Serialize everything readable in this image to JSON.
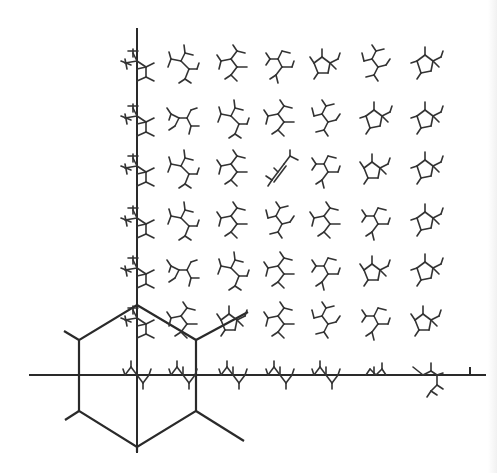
{
  "figure": {
    "type": "molecular-conformation-map",
    "ink_color": "#2a2a2a",
    "background": "#ffffff"
  },
  "axes": {
    "vertical": {
      "x": 137,
      "y_top": 29,
      "y_bottom": 452
    },
    "horizontal": {
      "y": 375,
      "x_left": 30,
      "x_right": 485
    },
    "right_tick": {
      "x": 470,
      "y1": 368,
      "y2": 375
    }
  },
  "hexagon": {
    "vertices": [
      [
        137,
        305
      ],
      [
        196,
        340
      ],
      [
        196,
        411
      ],
      [
        137,
        447
      ],
      [
        79,
        411
      ],
      [
        79,
        340
      ]
    ],
    "spokes": [
      [
        [
          79,
          340
        ],
        [
          64,
          331
        ]
      ],
      [
        [
          79,
          411
        ],
        [
          65,
          420
        ]
      ],
      [
        [
          196,
          340
        ],
        [
          248,
          312
        ]
      ],
      [
        [
          196,
          411
        ],
        [
          244,
          441
        ]
      ],
      [
        [
          137,
          447
        ],
        [
          137,
          452
        ]
      ]
    ]
  },
  "grid": {
    "columns_x": [
      137,
      183,
      233,
      280,
      326,
      376,
      427
    ],
    "rows_y": [
      65,
      120,
      170,
      222,
      272,
      322,
      375
    ],
    "cells": [
      [
        "A",
        "B",
        "C",
        "D",
        "E",
        "F",
        "G"
      ],
      [
        "A",
        "H",
        "B",
        "C",
        "F",
        "G",
        "G"
      ],
      [
        "A",
        "B",
        "C",
        "I",
        "D",
        "E",
        "G"
      ],
      [
        "A",
        "B",
        "C",
        "F",
        "C",
        "D",
        "G"
      ],
      [
        "A",
        "H",
        "B",
        "C",
        "D",
        "E",
        "G"
      ],
      [
        "A",
        "C",
        "E",
        "C",
        "F",
        "D",
        "E"
      ],
      [
        "J",
        "J",
        "J",
        "J",
        "J",
        "K",
        "L"
      ]
    ]
  },
  "shapes": {
    "A": [
      [
        -4,
        -12,
        0,
        -4
      ],
      [
        -12,
        -2,
        0,
        -4
      ],
      [
        0,
        -4,
        9,
        2
      ],
      [
        9,
        2,
        9,
        12
      ],
      [
        9,
        12,
        0,
        16
      ],
      [
        0,
        4,
        9,
        2
      ],
      [
        -9,
        -14,
        1,
        -14
      ],
      [
        -4,
        -16,
        -4,
        -8
      ],
      [
        -16,
        -4,
        -6,
        0
      ],
      [
        -12,
        -6,
        -10,
        4
      ],
      [
        9,
        2,
        17,
        -2
      ],
      [
        9,
        12,
        17,
        16
      ]
    ],
    "B": [
      [
        -12,
        -6,
        -2,
        -4
      ],
      [
        -2,
        -4,
        2,
        -12
      ],
      [
        -2,
        -4,
        6,
        4
      ],
      [
        6,
        4,
        14,
        4
      ],
      [
        6,
        4,
        2,
        14
      ],
      [
        2,
        -12,
        10,
        -10
      ],
      [
        2,
        -12,
        1,
        -20
      ],
      [
        -12,
        -6,
        -14,
        -13
      ],
      [
        -12,
        -6,
        -15,
        2
      ],
      [
        2,
        14,
        -4,
        18
      ],
      [
        2,
        14,
        8,
        18
      ],
      [
        14,
        4,
        16,
        -2
      ]
    ],
    "C": [
      [
        -12,
        -4,
        -2,
        -6
      ],
      [
        -2,
        -6,
        4,
        -14
      ],
      [
        -2,
        -6,
        4,
        2
      ],
      [
        4,
        2,
        14,
        2
      ],
      [
        4,
        2,
        -2,
        10
      ],
      [
        4,
        -14,
        12,
        -12
      ],
      [
        4,
        -14,
        0,
        -20
      ],
      [
        -12,
        -4,
        -16,
        -10
      ],
      [
        -12,
        -4,
        -14,
        4
      ],
      [
        -2,
        10,
        -8,
        14
      ],
      [
        -2,
        10,
        4,
        16
      ]
    ],
    "D": [
      [
        -10,
        -6,
        -2,
        -6
      ],
      [
        -2,
        -6,
        2,
        -14
      ],
      [
        -2,
        -6,
        2,
        2
      ],
      [
        2,
        2,
        12,
        2
      ],
      [
        2,
        2,
        -4,
        10
      ],
      [
        -4,
        10,
        -10,
        14
      ],
      [
        -4,
        10,
        -2,
        18
      ],
      [
        2,
        -14,
        10,
        -12
      ],
      [
        -10,
        -6,
        -14,
        -12
      ],
      [
        -10,
        -6,
        -14,
        0
      ],
      [
        12,
        2,
        14,
        -4
      ]
    ],
    "E": [
      [
        -12,
        -2,
        -4,
        -8
      ],
      [
        -4,
        -8,
        4,
        -2
      ],
      [
        4,
        -2,
        2,
        8
      ],
      [
        2,
        8,
        -8,
        8
      ],
      [
        -8,
        8,
        -12,
        -2
      ],
      [
        4,
        -2,
        12,
        -6
      ],
      [
        4,
        -2,
        10,
        4
      ],
      [
        -4,
        -8,
        -4,
        -16
      ],
      [
        -12,
        -2,
        -16,
        -8
      ],
      [
        -8,
        8,
        -12,
        14
      ],
      [
        12,
        -6,
        14,
        -12
      ]
    ],
    "F": [
      [
        -12,
        -4,
        -4,
        -6
      ],
      [
        -4,
        -6,
        0,
        -14
      ],
      [
        -4,
        -6,
        2,
        2
      ],
      [
        2,
        2,
        10,
        0
      ],
      [
        2,
        2,
        -2,
        10
      ],
      [
        -2,
        10,
        -10,
        12
      ],
      [
        -2,
        10,
        2,
        16
      ],
      [
        0,
        -14,
        8,
        -16
      ],
      [
        0,
        -14,
        -4,
        -20
      ],
      [
        -12,
        -4,
        -14,
        -12
      ],
      [
        10,
        0,
        14,
        -6
      ]
    ],
    "G": [
      [
        -10,
        -4,
        -2,
        -10
      ],
      [
        -2,
        -10,
        6,
        -4
      ],
      [
        6,
        -4,
        4,
        6
      ],
      [
        4,
        6,
        -6,
        8
      ],
      [
        -6,
        8,
        -10,
        -4
      ],
      [
        6,
        -4,
        14,
        -8
      ],
      [
        6,
        -4,
        12,
        2
      ],
      [
        -2,
        -10,
        -2,
        -18
      ],
      [
        -10,
        -4,
        -16,
        -2
      ],
      [
        -6,
        8,
        -10,
        14
      ],
      [
        14,
        -8,
        16,
        -14
      ]
    ],
    "H": [
      [
        -12,
        -6,
        -4,
        -2
      ],
      [
        -4,
        -2,
        4,
        -2
      ],
      [
        4,
        -2,
        8,
        -10
      ],
      [
        4,
        -2,
        8,
        6
      ],
      [
        8,
        6,
        16,
        6
      ],
      [
        8,
        6,
        6,
        14
      ],
      [
        -4,
        -2,
        -8,
        6
      ],
      [
        -12,
        -6,
        -16,
        -12
      ],
      [
        -12,
        -6,
        -14,
        0
      ],
      [
        8,
        -10,
        14,
        -12
      ],
      [
        -8,
        6,
        -14,
        10
      ]
    ],
    "I": [
      [
        -8,
        10,
        4,
        -6
      ],
      [
        -6,
        12,
        6,
        -4
      ],
      [
        4,
        -6,
        10,
        -14
      ],
      [
        10,
        -14,
        18,
        -10
      ],
      [
        10,
        -14,
        10,
        -20
      ],
      [
        -8,
        10,
        -14,
        6
      ],
      [
        -8,
        10,
        -12,
        16
      ],
      [
        -2,
        2,
        -6,
        -2
      ]
    ],
    "J": [
      [
        -12,
        0,
        -6,
        -8
      ],
      [
        -6,
        -8,
        0,
        0
      ],
      [
        0,
        0,
        6,
        8
      ],
      [
        6,
        8,
        12,
        0
      ],
      [
        -6,
        -8,
        -6,
        -14
      ],
      [
        6,
        8,
        6,
        14
      ],
      [
        12,
        0,
        14,
        -6
      ],
      [
        -12,
        0,
        -14,
        -6
      ],
      [
        0,
        0,
        0,
        -8
      ]
    ],
    "K": [
      [
        -10,
        0,
        -6,
        -6
      ],
      [
        -6,
        -6,
        0,
        0
      ],
      [
        0,
        0,
        6,
        -6
      ],
      [
        6,
        -6,
        10,
        0
      ],
      [
        -2,
        0,
        -2,
        -8
      ],
      [
        6,
        -6,
        6,
        -12
      ]
    ],
    "L": [
      [
        -14,
        -8,
        -4,
        0
      ],
      [
        -4,
        0,
        4,
        -4
      ],
      [
        4,
        -4,
        10,
        0
      ],
      [
        10,
        0,
        16,
        -2
      ],
      [
        4,
        -4,
        4,
        -12
      ],
      [
        10,
        0,
        10,
        10
      ],
      [
        10,
        10,
        4,
        16
      ],
      [
        10,
        10,
        16,
        14
      ],
      [
        4,
        16,
        0,
        22
      ],
      [
        4,
        16,
        10,
        20
      ]
    ]
  }
}
